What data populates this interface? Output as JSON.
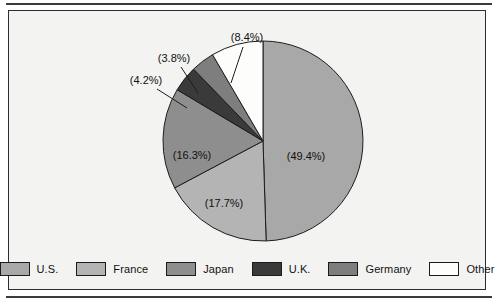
{
  "chart_data": {
    "type": "pie",
    "title": "",
    "subtitle": "",
    "xlabel": "",
    "ylabel": "",
    "legend_position": "bottom",
    "grid": false,
    "start_angle_deg": 0,
    "direction": "clockwise",
    "categories": [
      "U.S.",
      "France",
      "Japan",
      "U.K.",
      "Germany",
      "Other"
    ],
    "values": [
      49.4,
      17.7,
      16.3,
      4.2,
      3.8,
      8.4
    ],
    "value_unit": "%",
    "slices": [
      {
        "label": "U.S.",
        "value": 49.4,
        "display": "(49.4%)",
        "color": "#a8a8a8",
        "label_placement": "inside"
      },
      {
        "label": "France",
        "value": 17.7,
        "display": "(17.7%)",
        "color": "#b4b4b4",
        "label_placement": "inside"
      },
      {
        "label": "Japan",
        "value": 16.3,
        "display": "(16.3%)",
        "color": "#8e8e8e",
        "label_placement": "inside"
      },
      {
        "label": "U.K.",
        "value": 4.2,
        "display": "(4.2%)",
        "color": "#3a3a3a",
        "label_placement": "callout"
      },
      {
        "label": "Germany",
        "value": 3.8,
        "display": "(3.8%)",
        "color": "#7e7e7e",
        "label_placement": "callout"
      },
      {
        "label": "Other",
        "value": 8.4,
        "display": "(8.4%)",
        "color": "#fdfdfb",
        "label_placement": "callout"
      }
    ]
  },
  "legend": {
    "entries": [
      {
        "label": "U.S.",
        "color": "#a8a8a8"
      },
      {
        "label": "France",
        "color": "#b4b4b4"
      },
      {
        "label": "Japan",
        "color": "#8e8e8e"
      },
      {
        "label": "U.K.",
        "color": "#3a3a3a"
      },
      {
        "label": "Germany",
        "color": "#7e7e7e"
      },
      {
        "label": "Other",
        "color": "#fdfdfb"
      }
    ]
  },
  "labels": {
    "us_pct": "(49.4%)",
    "france_pct": "(17.7%)",
    "japan_pct": "(16.3%)",
    "uk_pct": "(4.2%)",
    "germany_pct": "(3.8%)",
    "other_pct": "(8.4%)"
  },
  "colors": {
    "panel_background": "#f3f3f1",
    "panel_border": "#2e2e2e",
    "rule": "#3b3b3b",
    "pie_outline": "#1c1c1c",
    "text": "#111111"
  }
}
